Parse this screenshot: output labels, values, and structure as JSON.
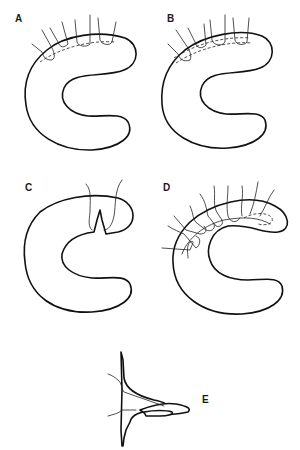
{
  "figure": {
    "panels": [
      {
        "id": "A",
        "label": "A",
        "description": "C-shaped tissue with interrupted sutures along outer curve"
      },
      {
        "id": "B",
        "label": "B",
        "description": "C-shaped tissue with interrupted sutures, double dashed line"
      },
      {
        "id": "C",
        "label": "C",
        "description": "C-shaped tissue with single pointed fold and two threads"
      },
      {
        "id": "D",
        "label": "D",
        "description": "C-shaped tissue with running sutures along whole band, dashed end loop"
      },
      {
        "id": "E",
        "label": "E",
        "description": "Cross-section view of sutured fold"
      }
    ],
    "colors": {
      "line": "#111111",
      "background": "#ffffff"
    }
  }
}
